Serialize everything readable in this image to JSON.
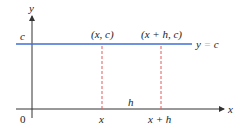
{
  "diagram": {
    "y_axis_label": "y",
    "x_axis_label": "x",
    "origin_label": "0",
    "c_label": "c",
    "point1_label": "(x, c)",
    "point2_label": "(x + h, c)",
    "line_label_y": "y",
    "line_label_eq": " = ",
    "line_label_c": "c",
    "x_tick_label": "x",
    "xh_tick_label": "x + h",
    "h_label": "h",
    "colors": {
      "line": "#3f6fd6",
      "dashed": "#e05a5a",
      "axis": "#333333",
      "equals": "#c9c200"
    }
  }
}
